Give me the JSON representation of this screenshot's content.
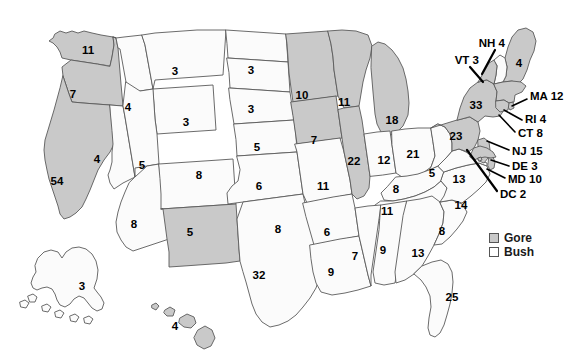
{
  "chart_data": {
    "type": "map",
    "title": "",
    "legend": {
      "position": "bottom-right",
      "entries": [
        {
          "label": "Gore",
          "color": "#c9c9c9",
          "swatch": "gore"
        },
        {
          "label": "Bush",
          "color": "#ffffff",
          "swatch": "bush"
        }
      ]
    },
    "value_label": "Electoral votes",
    "categories": [
      "WA",
      "OR",
      "CA",
      "NV",
      "ID",
      "MT",
      "WY",
      "UT",
      "AZ",
      "CO",
      "NM",
      "ND",
      "SD",
      "NE",
      "KS",
      "OK",
      "TX",
      "MN",
      "IA",
      "MO",
      "AR",
      "LA",
      "WI",
      "IL",
      "MI",
      "IN",
      "OH",
      "KY",
      "TN",
      "MS",
      "AL",
      "GA",
      "FL",
      "SC",
      "NC",
      "VA",
      "WV",
      "PA",
      "NY",
      "NJ",
      "DE",
      "MD",
      "DC",
      "CT",
      "RI",
      "MA",
      "VT",
      "NH",
      "ME",
      "AK",
      "HI"
    ],
    "values": [
      11,
      7,
      54,
      4,
      4,
      3,
      3,
      5,
      8,
      8,
      5,
      3,
      3,
      5,
      6,
      8,
      32,
      10,
      7,
      11,
      6,
      9,
      11,
      22,
      18,
      12,
      21,
      8,
      11,
      7,
      9,
      13,
      25,
      8,
      14,
      13,
      5,
      23,
      33,
      15,
      3,
      10,
      2,
      8,
      4,
      12,
      3,
      4,
      4,
      3,
      4
    ],
    "winners": [
      "Gore",
      "Gore",
      "Gore",
      "Bush",
      "Bush",
      "Bush",
      "Bush",
      "Bush",
      "Bush",
      "Bush",
      "Gore",
      "Bush",
      "Bush",
      "Bush",
      "Bush",
      "Bush",
      "Bush",
      "Gore",
      "Gore",
      "Bush",
      "Bush",
      "Bush",
      "Gore",
      "Gore",
      "Gore",
      "Bush",
      "Bush",
      "Bush",
      "Bush",
      "Bush",
      "Bush",
      "Bush",
      "Bush",
      "Bush",
      "Bush",
      "Bush",
      "Bush",
      "Gore",
      "Gore",
      "Gore",
      "Gore",
      "Gore",
      "Gore",
      "Gore",
      "Gore",
      "Gore",
      "Gore",
      "Bush",
      "Gore",
      "Bush",
      "Gore"
    ]
  },
  "map": {
    "states": [
      {
        "id": "WA",
        "ev": "11",
        "winner": "Gore",
        "lx": 88,
        "ly": 51
      },
      {
        "id": "OR",
        "ev": "7",
        "winner": "Gore",
        "lx": 73,
        "ly": 95
      },
      {
        "id": "CA",
        "ev": "54",
        "winner": "Gore",
        "lx": 57,
        "ly": 182
      },
      {
        "id": "NV",
        "ev": "4",
        "winner": "Bush",
        "lx": 97,
        "ly": 160
      },
      {
        "id": "ID",
        "ev": "4",
        "winner": "Bush",
        "lx": 128,
        "ly": 108
      },
      {
        "id": "MT",
        "ev": "3",
        "winner": "Bush",
        "lx": 175,
        "ly": 72
      },
      {
        "id": "WY",
        "ev": "3",
        "winner": "Bush",
        "lx": 186,
        "ly": 123
      },
      {
        "id": "UT",
        "ev": "5",
        "winner": "Bush",
        "lx": 142,
        "ly": 166
      },
      {
        "id": "AZ",
        "ev": "8",
        "winner": "Bush",
        "lx": 134,
        "ly": 225
      },
      {
        "id": "CO",
        "ev": "8",
        "winner": "Bush",
        "lx": 199,
        "ly": 176
      },
      {
        "id": "NM",
        "ev": "5",
        "winner": "Gore",
        "lx": 190,
        "ly": 233
      },
      {
        "id": "ND",
        "ev": "3",
        "winner": "Bush",
        "lx": 251,
        "ly": 71
      },
      {
        "id": "SD",
        "ev": "3",
        "winner": "Bush",
        "lx": 251,
        "ly": 110
      },
      {
        "id": "NE",
        "ev": "5",
        "winner": "Bush",
        "lx": 257,
        "ly": 148
      },
      {
        "id": "KS",
        "ev": "6",
        "winner": "Bush",
        "lx": 259,
        "ly": 187
      },
      {
        "id": "OK",
        "ev": "8",
        "winner": "Bush",
        "lx": 278,
        "ly": 230
      },
      {
        "id": "TX",
        "ev": "32",
        "winner": "Bush",
        "lx": 259,
        "ly": 276
      },
      {
        "id": "MN",
        "ev": "10",
        "winner": "Gore",
        "lx": 302,
        "ly": 96
      },
      {
        "id": "IA",
        "ev": "7",
        "winner": "Gore",
        "lx": 314,
        "ly": 141
      },
      {
        "id": "MO",
        "ev": "11",
        "winner": "Bush",
        "lx": 323,
        "ly": 187
      },
      {
        "id": "AR",
        "ev": "6",
        "winner": "Bush",
        "lx": 327,
        "ly": 233
      },
      {
        "id": "LA",
        "ev": "9",
        "winner": "Bush",
        "lx": 331,
        "ly": 273
      },
      {
        "id": "WI",
        "ev": "11",
        "winner": "Gore",
        "lx": 344,
        "ly": 103
      },
      {
        "id": "IL",
        "ev": "22",
        "winner": "Gore",
        "lx": 354,
        "ly": 162
      },
      {
        "id": "MI",
        "ev": "18",
        "winner": "Gore",
        "lx": 392,
        "ly": 121
      },
      {
        "id": "IN",
        "ev": "12",
        "winner": "Bush",
        "lx": 384,
        "ly": 161
      },
      {
        "id": "OH",
        "ev": "21",
        "winner": "Bush",
        "lx": 413,
        "ly": 155
      },
      {
        "id": "KY",
        "ev": "8",
        "winner": "Bush",
        "lx": 396,
        "ly": 190
      },
      {
        "id": "TN",
        "ev": "11",
        "winner": "Bush",
        "lx": 387,
        "ly": 212
      },
      {
        "id": "MS",
        "ev": "7",
        "winner": "Bush",
        "lx": 355,
        "ly": 257
      },
      {
        "id": "AL",
        "ev": "9",
        "winner": "Bush",
        "lx": 383,
        "ly": 251
      },
      {
        "id": "GA",
        "ev": "13",
        "winner": "Bush",
        "lx": 418,
        "ly": 254
      },
      {
        "id": "FL",
        "ev": "25",
        "winner": "Bush",
        "lx": 452,
        "ly": 298
      },
      {
        "id": "SC",
        "ev": "8",
        "winner": "Bush",
        "lx": 442,
        "ly": 232
      },
      {
        "id": "NC",
        "ev": "14",
        "winner": "Bush",
        "lx": 461,
        "ly": 206
      },
      {
        "id": "VA",
        "ev": "13",
        "winner": "Bush",
        "lx": 459,
        "ly": 180
      },
      {
        "id": "WV",
        "ev": "5",
        "winner": "Bush",
        "lx": 432,
        "ly": 174
      },
      {
        "id": "PA",
        "ev": "23",
        "winner": "Gore",
        "lx": 456,
        "ly": 137
      },
      {
        "id": "NY",
        "ev": "33",
        "winner": "Gore",
        "lx": 476,
        "ly": 106
      },
      {
        "id": "ME",
        "ev": "4",
        "winner": "Gore",
        "lx": 519,
        "ly": 64
      },
      {
        "id": "AK",
        "ev": "3",
        "winner": "Bush",
        "lx": 82,
        "ly": 287
      },
      {
        "id": "HI",
        "ev": "4",
        "winner": "Gore",
        "lx": 175,
        "ly": 327
      }
    ],
    "callouts": [
      {
        "id": "NH",
        "label": "NH 4",
        "tx": 505,
        "ty": 44,
        "align": "end",
        "x1": 495,
        "y1": 50,
        "x2": 482,
        "y2": 74
      },
      {
        "id": "VT",
        "label": "VT 3",
        "tx": 479,
        "ty": 61,
        "align": "end",
        "x1": 470,
        "y1": 67,
        "x2": 483,
        "y2": 82
      },
      {
        "id": "MA",
        "label": "MA 12",
        "tx": 530,
        "ty": 97,
        "align": "start",
        "x1": 527,
        "y1": 99,
        "x2": 512,
        "y2": 106
      },
      {
        "id": "RI",
        "label": "RI 4",
        "tx": 525,
        "ty": 120,
        "align": "start",
        "x1": 522,
        "y1": 120,
        "x2": 504,
        "y2": 110
      },
      {
        "id": "CT",
        "label": "CT 8",
        "tx": 518,
        "ty": 134,
        "align": "start",
        "x1": 515,
        "y1": 132,
        "x2": 499,
        "y2": 115
      },
      {
        "id": "NJ",
        "label": "NJ 15",
        "tx": 512,
        "ty": 152,
        "align": "start",
        "x1": 509,
        "y1": 150,
        "x2": 487,
        "y2": 141
      },
      {
        "id": "DE",
        "label": "DE 3",
        "tx": 512,
        "ty": 167,
        "align": "start",
        "x1": 509,
        "y1": 166,
        "x2": 491,
        "y2": 160
      },
      {
        "id": "MD",
        "label": "MD 10",
        "tx": 508,
        "ty": 180,
        "align": "start",
        "x1": 505,
        "y1": 178,
        "x2": 487,
        "y2": 169
      },
      {
        "id": "DC",
        "label": "DC 2",
        "tx": 500,
        "ty": 195,
        "align": "start",
        "x1": 497,
        "y1": 191,
        "x2": 467,
        "y2": 150
      }
    ]
  },
  "legend": {
    "gore_label": "Gore",
    "bush_label": "Bush"
  }
}
